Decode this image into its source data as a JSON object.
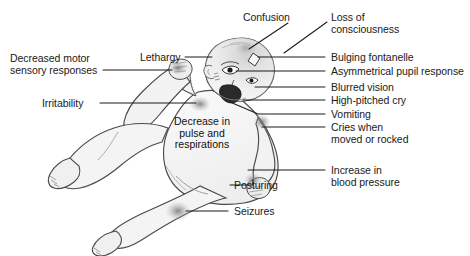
{
  "diagram": {
    "background_color": "#ffffff",
    "body_fill_color": "#f2f2f2",
    "outline_color": "#3a3a3a",
    "leader_line_color": "#1a1a1a",
    "text_color": "#1a1a1a",
    "shading_spot_color": "#8d8d8d"
  },
  "labels": {
    "decreased_motor": "Decreased motor\nsensory responses",
    "irritability": "Irritability",
    "lethargy": "Lethargy",
    "confusion": "Confusion",
    "loss_of_consciousness": "Loss of\nconsciousness",
    "bulging_fontanelle": "Bulging fontanelle",
    "asymmetrical_pupil_response": "Asymmetrical pupil response",
    "blurred_vision": "Blurred vision",
    "high_pitched_cry": "High-pitched cry",
    "vomiting": "Vomiting",
    "cries_when_moved": "Cries when\nmoved or rocked",
    "increase_in_blood_pressure": "Increase in\nblood pressure",
    "posturing": "Posturing",
    "seizures": "Seizures",
    "decrease_in_pulse": "Decrease in\npulse and\nrespirations"
  },
  "label_list": [
    {
      "id": "decreased-motor-sensory-responses",
      "text": "Decreased motor sensory responses",
      "side": "left"
    },
    {
      "id": "irritability",
      "text": "Irritability",
      "side": "left"
    },
    {
      "id": "lethargy",
      "text": "Lethargy",
      "side": "left"
    },
    {
      "id": "confusion",
      "text": "Confusion",
      "side": "top"
    },
    {
      "id": "loss-of-consciousness",
      "text": "Loss of consciousness",
      "side": "right"
    },
    {
      "id": "bulging-fontanelle",
      "text": "Bulging fontanelle",
      "side": "right"
    },
    {
      "id": "asymmetrical-pupil-response",
      "text": "Asymmetrical pupil response",
      "side": "right"
    },
    {
      "id": "blurred-vision",
      "text": "Blurred vision",
      "side": "right"
    },
    {
      "id": "high-pitched-cry",
      "text": "High-pitched cry",
      "side": "right"
    },
    {
      "id": "vomiting",
      "text": "Vomiting",
      "side": "right"
    },
    {
      "id": "cries-when-moved-or-rocked",
      "text": "Cries when moved or rocked",
      "side": "right"
    },
    {
      "id": "increase-in-blood-pressure",
      "text": "Increase in blood pressure",
      "side": "right"
    },
    {
      "id": "posturing",
      "text": "Posturing",
      "side": "right"
    },
    {
      "id": "seizures",
      "text": "Seizures",
      "side": "right"
    },
    {
      "id": "decrease-in-pulse-and-respirations",
      "text": "Decrease in pulse and respirations",
      "side": "center"
    }
  ]
}
